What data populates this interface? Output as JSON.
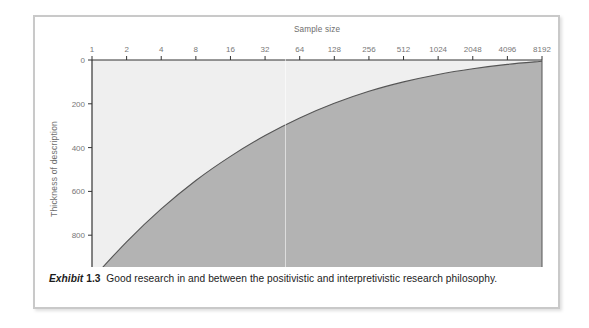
{
  "figure": {
    "caption_label": "Exhibit",
    "caption_number": "1.3",
    "caption_text": "Good research in and between the positivistic and interpretivistic research philosophy."
  },
  "colors": {
    "frame_border": "#c9c9c9",
    "area_fill": "#b3b3b3",
    "plot_background": "#efefef",
    "curve_stroke": "#555555",
    "axis_stroke": "#333333",
    "tick_label": "#777777",
    "axis_title": "#6e6e6e",
    "caption_text": "#1b1b1b"
  },
  "chart_data": {
    "type": "area",
    "title": "",
    "xlabel": "Sample size",
    "ylabel": "Thickness of description",
    "x_axis_position": "top",
    "y_axis_inverted": true,
    "x_scale": "log2",
    "grid": false,
    "legend": "none",
    "categories": [
      "1",
      "2",
      "4",
      "8",
      "16",
      "32",
      "64",
      "128",
      "256",
      "512",
      "1024",
      "2048",
      "4096",
      "8192"
    ],
    "x_tick_labels": [
      "1",
      "2",
      "4",
      "8",
      "16",
      "32",
      "64",
      "128",
      "256",
      "512",
      "1024",
      "2048",
      "4096",
      "8192"
    ],
    "y_tick_labels": [
      "0",
      "200",
      "400",
      "600",
      "800",
      "1000"
    ],
    "y_ticks": [
      0,
      200,
      400,
      600,
      800,
      1000
    ],
    "ylim": [
      0,
      1000
    ],
    "xlim": [
      1,
      8192
    ],
    "series": [
      {
        "name": "Thickness of description",
        "x": [
          1,
          2,
          4,
          8,
          16,
          32,
          64,
          128,
          256,
          512,
          1024,
          2048,
          4096,
          8192
        ],
        "values": [
          1000,
          830,
          680,
          550,
          440,
          345,
          265,
          198,
          143,
          100,
          66,
          40,
          20,
          6
        ]
      }
    ],
    "annotations": []
  }
}
